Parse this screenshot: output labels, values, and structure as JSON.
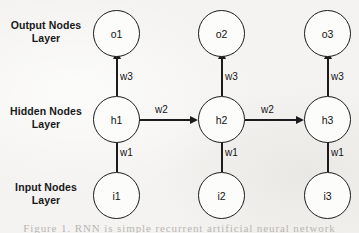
{
  "figure": {
    "caption": "Figure 1.    RNN is simple recurrent artificial neural network",
    "background_color": "#f4f3f1",
    "stroke_color": "#1b1b1d",
    "node_fill_color": "#fcfcfb"
  },
  "layers": [
    {
      "name": "output",
      "line1": "Output Nodes",
      "line2": "Layer"
    },
    {
      "name": "hidden",
      "line1": "Hidden Nodes",
      "line2": "Layer"
    },
    {
      "name": "input",
      "line1": "Input Nodes",
      "line2": "Layer"
    }
  ],
  "nodes": {
    "output": [
      {
        "label": "o1"
      },
      {
        "label": "o2"
      },
      {
        "label": "o3"
      }
    ],
    "hidden": [
      {
        "label": "h1"
      },
      {
        "label": "h2"
      },
      {
        "label": "h3"
      }
    ],
    "input": [
      {
        "label": "i1"
      },
      {
        "label": "i2"
      },
      {
        "label": "i3"
      }
    ]
  },
  "weights": {
    "hidden_to_output": [
      "w3",
      "w3",
      "w3"
    ],
    "input_to_hidden": [
      "w1",
      "w1",
      "w1"
    ],
    "hidden_to_hidden": [
      "w2",
      "w2"
    ]
  },
  "chart_data": {
    "type": "diagram",
    "title": "Figure 1.    RNN is simple recurrent artificial neural network",
    "layout": "3 columns (timesteps) x 3 rows (layers)",
    "layer_labels": [
      "Output Nodes Layer",
      "Hidden Nodes Layer",
      "Input Nodes Layer"
    ],
    "nodes": [
      "o1",
      "o2",
      "o3",
      "h1",
      "h2",
      "h3",
      "i1",
      "i2",
      "i3"
    ],
    "edges": [
      {
        "from": "i1",
        "to": "h1",
        "label": "w1",
        "direction": "up"
      },
      {
        "from": "i2",
        "to": "h2",
        "label": "w1",
        "direction": "up"
      },
      {
        "from": "i3",
        "to": "h3",
        "label": "w1",
        "direction": "up"
      },
      {
        "from": "h1",
        "to": "o1",
        "label": "w3",
        "direction": "up"
      },
      {
        "from": "h2",
        "to": "o2",
        "label": "w3",
        "direction": "up"
      },
      {
        "from": "h3",
        "to": "o3",
        "label": "w3",
        "direction": "up"
      },
      {
        "from": "h1",
        "to": "h2",
        "label": "w2",
        "direction": "right"
      },
      {
        "from": "h2",
        "to": "h3",
        "label": "w2",
        "direction": "right"
      }
    ],
    "weight_names": [
      "w1",
      "w2",
      "w3"
    ]
  }
}
